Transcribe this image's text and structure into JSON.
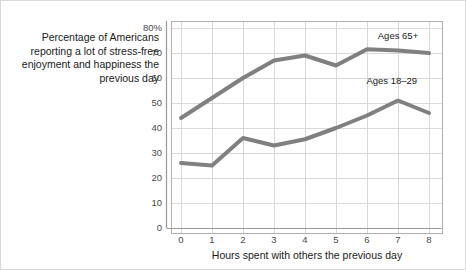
{
  "chart_data": {
    "type": "line",
    "title": "",
    "caption": "Percentage of Americans reporting a lot of stress-free enjoyment and happiness the previous day",
    "xlabel": "Hours spent with others the previous day",
    "ylabel": "",
    "x": [
      0,
      1,
      2,
      3,
      4,
      5,
      6,
      7,
      8
    ],
    "xtick_labels": [
      "0",
      "1",
      "2",
      "3",
      "4",
      "5",
      "6",
      "7",
      "8"
    ],
    "ytick_labels": [
      "0",
      "10",
      "20",
      "30",
      "40",
      "50",
      "60",
      "70",
      "80%"
    ],
    "yticks": [
      0,
      10,
      20,
      30,
      40,
      50,
      60,
      70,
      80
    ],
    "xlim": [
      0,
      8
    ],
    "ylim": [
      0,
      80
    ],
    "grid": true,
    "legend_position": "inline-annotations",
    "series": [
      {
        "name": "Ages 65+",
        "label": "Ages 65+",
        "color": "#808080",
        "values": [
          44,
          52,
          60,
          67,
          69,
          65,
          71.5,
          71,
          70
        ],
        "label_x": 7.0,
        "label_y": 75.5
      },
      {
        "name": "Ages 18–29",
        "label": "Ages 18–29",
        "color": "#808080",
        "values": [
          26,
          25,
          36,
          33,
          35.5,
          40,
          45,
          51,
          46
        ],
        "label_x": 6.8,
        "label_y": 57.5
      }
    ],
    "colors": {
      "line": "#808080",
      "grid": "#d9d9d9",
      "axis": "#b0b0b0",
      "text": "#1a1a1a",
      "tick_text": "#4a4a4a",
      "background": "#ffffff",
      "border": "#d8d8d8"
    }
  }
}
